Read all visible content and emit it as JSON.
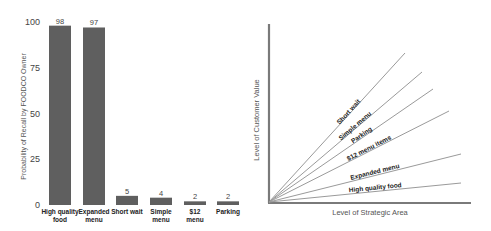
{
  "chart_data": [
    {
      "type": "bar",
      "title": "",
      "xlabel": "",
      "ylabel": "Probability of Recall by FOODCO Owner",
      "ylim": [
        0,
        100
      ],
      "yticks": [
        0,
        25,
        50,
        75,
        100
      ],
      "grid": false,
      "categories": [
        "High quality food",
        "Expanded menu",
        "Short wait",
        "Simple menu",
        "$12 menu",
        "Parking"
      ],
      "category_lines": [
        [
          "High quality",
          "food"
        ],
        [
          "Expanded",
          "menu"
        ],
        [
          "Short wait"
        ],
        [
          "Simple",
          "menu"
        ],
        [
          "$12",
          "menu"
        ],
        [
          "Parking"
        ]
      ],
      "values": [
        98,
        97,
        5,
        4,
        2,
        2
      ],
      "bar_color": "#5f5f5f"
    },
    {
      "type": "line",
      "title": "",
      "xlabel": "Level of  Strategic Area",
      "ylabel": "Level of Customer Value",
      "grid": false,
      "axis_color": "#7a7a7a",
      "line_color": "#9a9a9a",
      "series": [
        {
          "name": "Short wait",
          "end": [
            405,
            53
          ]
        },
        {
          "name": "Simple menu",
          "end": [
            422,
            72
          ]
        },
        {
          "name": "Parking",
          "end": [
            433,
            89
          ]
        },
        {
          "name": "$12 menu items",
          "end": [
            449,
            111
          ]
        },
        {
          "name": "Expanded menu",
          "end": [
            461,
            154
          ]
        },
        {
          "name": "High quality food",
          "end": [
            461,
            183
          ]
        }
      ]
    }
  ]
}
